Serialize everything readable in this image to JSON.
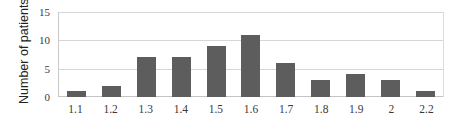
{
  "chart_data": {
    "type": "bar",
    "title": "",
    "xlabel": "",
    "ylabel": "Number of patients",
    "categories": [
      "1.1",
      "1.2",
      "1.3",
      "1.4",
      "1.5",
      "1.6",
      "1.7",
      "1.8",
      "1.9",
      "2",
      "2.2"
    ],
    "values": [
      1,
      2,
      7,
      7,
      9,
      11,
      6,
      3,
      4,
      3,
      1
    ],
    "ylim": [
      0,
      15
    ],
    "yticks": [
      "0",
      "5",
      "10",
      "15"
    ],
    "ytick_values": [
      0,
      5,
      10,
      15
    ],
    "grid": "horizontal",
    "legend": "none",
    "bar_color": "#5d5d5d",
    "gridline_color": "#d6d6d6",
    "axis_color": "#c4c4c4",
    "background": "#ffffff"
  }
}
